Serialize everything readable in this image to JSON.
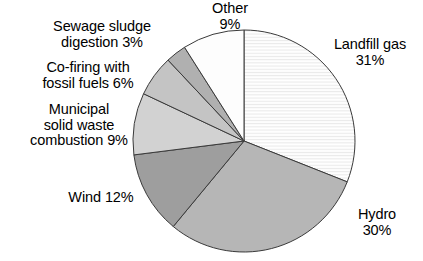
{
  "chart_data": {
    "type": "pie",
    "title": "",
    "subtitle": "",
    "xlabel": "",
    "ylabel": "",
    "legend_position": "none",
    "grid": false,
    "start_angle_deg": 0,
    "direction": "clockwise",
    "units": "percent",
    "categories": [
      "Landfill gas",
      "Hydro",
      "Wind",
      "Municipal solid waste combustion",
      "Co-firing with fossil fuels",
      "Sewage sludge digestion",
      "Other"
    ],
    "values": [
      31,
      30,
      12,
      9,
      6,
      3,
      9
    ],
    "slices": [
      {
        "key": "landfill-gas",
        "name": "Landfill gas",
        "value": 31,
        "value_text": "31%",
        "label_lines": [
          "Landfill gas",
          "31%"
        ],
        "fill": "#fbfbfb",
        "pattern": "horizontal-lines",
        "start_deg": 0,
        "end_deg": 111.6
      },
      {
        "key": "hydro",
        "name": "Hydro",
        "value": 30,
        "value_text": "30%",
        "label_lines": [
          "Hydro",
          "30%"
        ],
        "fill": "#b6b6b6",
        "pattern": "solid",
        "start_deg": 111.6,
        "end_deg": 219.6
      },
      {
        "key": "wind",
        "name": "Wind",
        "value": 12,
        "value_text": "12%",
        "label_lines": [
          "Wind 12%"
        ],
        "fill": "#9e9e9e",
        "pattern": "solid",
        "start_deg": 219.6,
        "end_deg": 262.8
      },
      {
        "key": "municipal-solid-waste-combustion",
        "name": "Municipal solid waste combustion",
        "value": 9,
        "value_text": "9%",
        "label_lines": [
          "Municipal",
          "solid waste",
          "combustion 9%"
        ],
        "fill": "#d2d2d2",
        "pattern": "solid",
        "start_deg": 262.8,
        "end_deg": 295.2
      },
      {
        "key": "co-firing-with-fossil-fuels",
        "name": "Co-firing with fossil fuels",
        "value": 6,
        "value_text": "6%",
        "label_lines": [
          "Co-firing with",
          "fossil fuels 6%"
        ],
        "fill": "#c4c4c4",
        "pattern": "solid",
        "start_deg": 295.2,
        "end_deg": 316.8
      },
      {
        "key": "sewage-sludge-digestion",
        "name": "Sewage sludge digestion",
        "value": 3,
        "value_text": "3%",
        "label_lines": [
          "Sewage sludge",
          "digestion 3%"
        ],
        "fill": "#b0b0b0",
        "pattern": "solid",
        "start_deg": 316.8,
        "end_deg": 327.6
      },
      {
        "key": "other",
        "name": "Other",
        "value": 9,
        "value_text": "9%",
        "label_lines": [
          "Other",
          "9%"
        ],
        "fill": "#fdfdfd",
        "pattern": "solid",
        "start_deg": 327.6,
        "end_deg": 360
      }
    ],
    "geometry": {
      "center_x": 244,
      "center_y": 141,
      "radius": 111,
      "stroke": "#3a3a3a",
      "stroke_width": 1
    }
  },
  "labels": {
    "other": "Other\n9%",
    "sewage_sludge": "Sewage sludge\ndigestion 3%",
    "cofiring": "Co-firing with\nfossil fuels 6%",
    "municipal": "Municipal\nsolid waste\ncombustion 9%",
    "wind": "Wind 12%",
    "landfill": "Landfill gas\n31%",
    "hydro": "Hydro\n30%"
  }
}
